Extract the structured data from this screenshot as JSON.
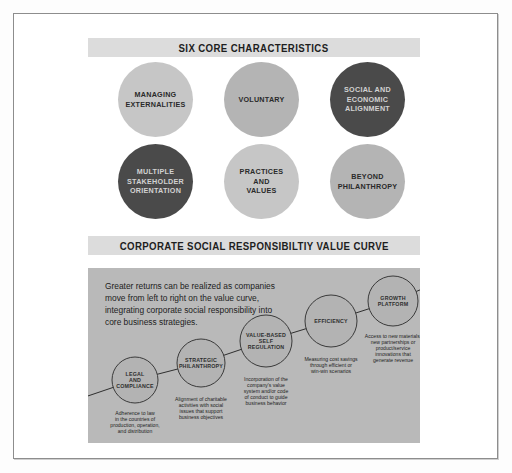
{
  "sections": {
    "six_core": {
      "banner_title": "SIX CORE CHARACTERISTICS",
      "circles": [
        {
          "label": "MANAGING\nEXTERNALITIES",
          "tone": "light",
          "text_tone": "dark"
        },
        {
          "label": "VOLUNTARY",
          "tone": "mid",
          "text_tone": "dark"
        },
        {
          "label": "SOCIAL AND\nECONOMIC\nALIGNMENT",
          "tone": "dark",
          "text_tone": "light"
        },
        {
          "label": "MULTIPLE\nSTAKEHOLDER\nORIENTATION",
          "tone": "dark",
          "text_tone": "light"
        },
        {
          "label": "PRACTICES\nAND\nVALUES",
          "tone": "light",
          "text_tone": "dark"
        },
        {
          "label": "BEYOND\nPHILANTHROPY",
          "tone": "mid",
          "text_tone": "dark"
        }
      ]
    },
    "value_curve": {
      "banner_title": "CORPORATE SOCIAL RESPONSIBILTIY VALUE CURVE",
      "intro": "Greater returns can be realized as companies move from left to right on the value curve, integrating corporate social responsibility into core business strategies.",
      "nodes": [
        {
          "title": [
            "LEGAL",
            "AND",
            "COMPLIANCE"
          ],
          "caption": [
            "Adherence to law",
            "in the countries of",
            "production, operation,",
            "and distribution"
          ]
        },
        {
          "title": [
            "STRATEGIC",
            "PHILANTHROPY"
          ],
          "caption": [
            "Alignment of charitable",
            "activities with social",
            "issues that support",
            "business objectives"
          ]
        },
        {
          "title": [
            "VALUE-BASED",
            "SELF",
            "REGULATION"
          ],
          "caption": [
            "Incorporation of the",
            "company's value",
            "system and/or code",
            "of conduct to guide",
            "business behavior"
          ]
        },
        {
          "title": [
            "EFFICIENCY"
          ],
          "caption": [
            "Measuring cost savings",
            "through efficient or",
            "win-win scenarios"
          ]
        },
        {
          "title": [
            "GROWTH",
            "PLATFORM"
          ],
          "caption": [
            "Access to new materials,",
            "new partnerships or",
            "product/service",
            "innovations that",
            "generate revenue"
          ]
        }
      ]
    }
  },
  "colors": {
    "panel_bg": "#b9b9b9",
    "banner_bg": "#dcdcdc",
    "circle_light": "#c6c6c6",
    "circle_mid": "#b4b4b4",
    "circle_dark": "#4a4a4a",
    "line": "#2f2f2f"
  }
}
